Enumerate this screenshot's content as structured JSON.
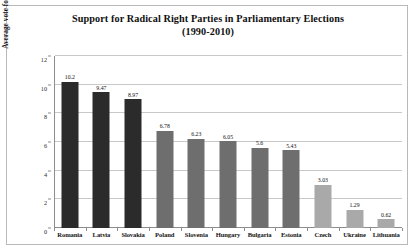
{
  "chart_data": {
    "type": "bar",
    "title": "Support for Radical Right Parties in Parliamentary Elections (1990-2010)",
    "title_line1": "Support for Radical Right Parties in Parliamentary Elections",
    "title_line2": "(1990-2010)",
    "xlabel": "",
    "ylabel": "Average vote for radical right parties (%)",
    "ylim": [
      0,
      12
    ],
    "ytick_labels": [
      "0",
      "2",
      "4",
      "6",
      "8",
      "10",
      "12"
    ],
    "yticks": [
      0,
      2,
      4,
      6,
      8,
      10,
      12
    ],
    "grid": true,
    "legend": "none",
    "categories": [
      "Romania",
      "Latvia",
      "Slovakia",
      "Poland",
      "Slovenia",
      "Hungary",
      "Bulgaria",
      "Estonia",
      "Czech",
      "Ukraine",
      "Lithuania"
    ],
    "values": [
      10.2,
      9.47,
      8.97,
      6.78,
      6.23,
      6.05,
      5.6,
      5.43,
      3.03,
      1.29,
      0.62
    ],
    "value_labels": [
      "10.2",
      "9.47",
      "8.97",
      "6.78",
      "6.23",
      "6.05",
      "5.6",
      "5.43",
      "3.03",
      "1.29",
      "0.62"
    ],
    "bar_colors": [
      "#2b2b2b",
      "#2b2b2b",
      "#2b2b2b",
      "#6e6e6e",
      "#6e6e6e",
      "#6e6e6e",
      "#6e6e6e",
      "#6e6e6e",
      "#a9a9a9",
      "#a9a9a9",
      "#a9a9a9"
    ]
  },
  "colors": {
    "background": "#ffffff",
    "frame_border": "#b9b9b9",
    "axis": "#8d8d8d",
    "gridline": "#c9c9c9",
    "text": "#121212",
    "bar_dark": "#2b2b2b",
    "bar_mid": "#6e6e6e",
    "bar_light": "#a9a9a9"
  }
}
